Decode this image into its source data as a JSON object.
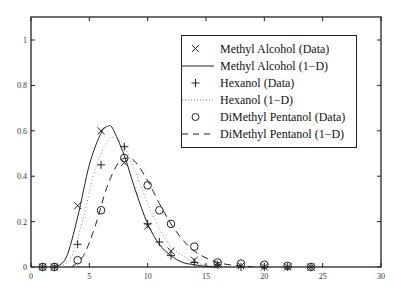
{
  "chart_data": {
    "type": "line",
    "title": "",
    "xlabel": "",
    "ylabel": "",
    "xlim": [
      0,
      30
    ],
    "ylim": [
      0,
      1.1
    ],
    "grid": false,
    "legend_position": "upper right",
    "x_ticks": [
      "0",
      "5",
      "10",
      "15",
      "20",
      "25",
      "30"
    ],
    "y_ticks": [
      "0",
      "0.2",
      "0.4",
      "0.6",
      "0.8",
      "1"
    ],
    "series": [
      {
        "name": "Methyl Alcohol (Data)",
        "style": "marker-x",
        "x": [
          1,
          2,
          4,
          6,
          8,
          10,
          12,
          14,
          16,
          18,
          20,
          22,
          24
        ],
        "y": [
          0,
          0,
          0.27,
          0.6,
          0.46,
          0.18,
          0.07,
          0.03,
          0.01,
          0.005,
          0,
          0,
          0
        ]
      },
      {
        "name": "Methyl Alcohol (1-D)",
        "style": "solid",
        "x": [
          2,
          3,
          4,
          5,
          6,
          6.6,
          7,
          8,
          9,
          10,
          11,
          12,
          13,
          14,
          15,
          16
        ],
        "y": [
          0,
          0.04,
          0.22,
          0.45,
          0.59,
          0.62,
          0.61,
          0.49,
          0.33,
          0.19,
          0.1,
          0.05,
          0.02,
          0.01,
          0.003,
          0
        ]
      },
      {
        "name": "Hexanol (Data)",
        "style": "marker-plus",
        "x": [
          1,
          2,
          4,
          6,
          8,
          10,
          11,
          12,
          14,
          16,
          18,
          20,
          22,
          24
        ],
        "y": [
          0,
          0,
          0.1,
          0.45,
          0.53,
          0.19,
          0.11,
          0.05,
          0.02,
          0.01,
          0,
          0,
          0,
          0
        ]
      },
      {
        "name": "Hexanol (1-D)",
        "style": "dotted",
        "x": [
          2.5,
          3.5,
          4.5,
          5.5,
          6.5,
          7.2,
          8,
          9,
          10,
          11,
          12,
          13,
          14,
          15,
          16,
          17
        ],
        "y": [
          0,
          0.05,
          0.22,
          0.43,
          0.55,
          0.57,
          0.53,
          0.41,
          0.28,
          0.17,
          0.09,
          0.05,
          0.02,
          0.01,
          0.003,
          0
        ]
      },
      {
        "name": "DiMethyl Pentanol (Data)",
        "style": "marker-circle",
        "x": [
          1,
          2,
          4,
          6,
          8,
          10,
          11,
          12,
          14,
          16,
          18,
          20,
          22,
          24
        ],
        "y": [
          0,
          0,
          0.03,
          0.25,
          0.48,
          0.36,
          0.25,
          0.19,
          0.09,
          0.02,
          0.015,
          0.01,
          0.005,
          0
        ]
      },
      {
        "name": "DiMethyl Pentanol (1-D)",
        "style": "dashed",
        "x": [
          3.5,
          4.5,
          5.5,
          6.5,
          7.5,
          8.3,
          9,
          10,
          11,
          12,
          13,
          14,
          15,
          16,
          17,
          18,
          19
        ],
        "y": [
          0,
          0.05,
          0.18,
          0.35,
          0.46,
          0.48,
          0.46,
          0.38,
          0.28,
          0.19,
          0.12,
          0.07,
          0.04,
          0.02,
          0.01,
          0.005,
          0
        ]
      }
    ]
  },
  "legend": {
    "items": [
      {
        "symbol": "×",
        "label": "Methyl Alcohol (Data)"
      },
      {
        "symbol": "solid",
        "label": "Methyl Alcohol (1−D)"
      },
      {
        "symbol": "+",
        "label": "Hexanol (Data)"
      },
      {
        "symbol": "dotted",
        "label": "Hexanol (1−D)"
      },
      {
        "symbol": "o",
        "label": "DiMethyl Pentanol (Data)"
      },
      {
        "symbol": "dashed",
        "label": "DiMethyl Pentanol (1−D)"
      }
    ]
  }
}
